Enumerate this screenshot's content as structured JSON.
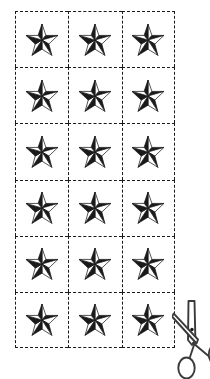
{
  "page": {
    "background_color": "#ffffff"
  },
  "cut_grid": {
    "name": "cut-out grid",
    "columns": 3,
    "rows": 6,
    "total_cells": 18,
    "line_style": "dashed",
    "line_color": "#1a1a1a",
    "cells": [
      {
        "row": 1,
        "col": 1,
        "content": "nautical-star"
      },
      {
        "row": 1,
        "col": 2,
        "content": "nautical-star"
      },
      {
        "row": 1,
        "col": 3,
        "content": "nautical-star"
      },
      {
        "row": 2,
        "col": 1,
        "content": "nautical-star"
      },
      {
        "row": 2,
        "col": 2,
        "content": "nautical-star"
      },
      {
        "row": 2,
        "col": 3,
        "content": "nautical-star"
      },
      {
        "row": 3,
        "col": 1,
        "content": "nautical-star"
      },
      {
        "row": 3,
        "col": 2,
        "content": "nautical-star"
      },
      {
        "row": 3,
        "col": 3,
        "content": "nautical-star"
      },
      {
        "row": 4,
        "col": 1,
        "content": "nautical-star"
      },
      {
        "row": 4,
        "col": 2,
        "content": "nautical-star"
      },
      {
        "row": 4,
        "col": 3,
        "content": "nautical-star"
      },
      {
        "row": 5,
        "col": 1,
        "content": "nautical-star"
      },
      {
        "row": 5,
        "col": 2,
        "content": "nautical-star"
      },
      {
        "row": 5,
        "col": 3,
        "content": "nautical-star"
      },
      {
        "row": 6,
        "col": 1,
        "content": "nautical-star"
      },
      {
        "row": 6,
        "col": 2,
        "content": "nautical-star"
      },
      {
        "row": 6,
        "col": 3,
        "content": "nautical-star"
      }
    ]
  },
  "star": {
    "icon_name": "nautical-star-icon",
    "points": 5,
    "style": "3d-faceted",
    "fill_dark": "#1a1a1a",
    "fill_light": "#ffffff",
    "stroke_color": "#1a1a1a"
  },
  "scissors": {
    "icon_name": "scissors-icon",
    "orientation": "blades-up",
    "stroke_color": "#3a3a3a",
    "fill_color": "#ffffff",
    "position": "bottom-right",
    "clipped": true
  }
}
